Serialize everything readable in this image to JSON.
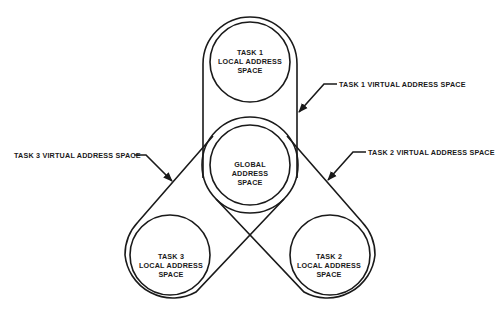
{
  "diagram": {
    "type": "address-space-overlap",
    "nodes": {
      "task1_local": {
        "lines": [
          "TASK 1",
          "LOCAL ADDRESS",
          "SPACE"
        ]
      },
      "global": {
        "lines": [
          "GLOBAL",
          "ADDRESS",
          "SPACE"
        ]
      },
      "task3_local": {
        "lines": [
          "TASK 3",
          "LOCAL ADDRESS",
          "SPACE"
        ]
      },
      "task2_local": {
        "lines": [
          "TASK 2",
          "LOCAL ADDRESS",
          "SPACE"
        ]
      }
    },
    "callouts": {
      "task1_virtual": "TASK 1 VIRTUAL ADDRESS SPACE",
      "task2_virtual": "TASK 2 VIRTUAL ADDRESS SPACE",
      "task3_virtual": "TASK 3 VIRTUAL ADDRESS SPACE"
    },
    "edges": [
      {
        "from": "task1_virtual",
        "to": "task1_local+global",
        "kind": "encloses"
      },
      {
        "from": "task2_virtual",
        "to": "task2_local+global",
        "kind": "encloses"
      },
      {
        "from": "task3_virtual",
        "to": "task3_local+global",
        "kind": "encloses"
      }
    ]
  }
}
